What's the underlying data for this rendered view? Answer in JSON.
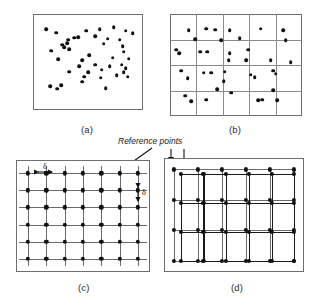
{
  "figure": {
    "panels": [
      {
        "id": "a",
        "caption": "(a)",
        "description": "randomly scattered points"
      },
      {
        "id": "b",
        "caption": "(b)",
        "description": "points partitioned by a grid of cells"
      },
      {
        "id": "c",
        "caption": "(c)",
        "description": "regular lattice of reference points with spacing delta"
      },
      {
        "id": "d",
        "caption": "(d)",
        "description": "two offset overlapping reference grids"
      }
    ]
  },
  "annotations": {
    "reference_points_label": "Reference points",
    "delta_horizontal": "δ",
    "delta_vertical": "δ"
  },
  "colors": {
    "dot": "#111111",
    "frame": "#6e6e6e",
    "gridline": "#8a8a8a",
    "lattice_primary": "#6a6a6a",
    "lattice_secondary": "#1a1a1a",
    "caption_text": "#2b2b2b",
    "background": "#ffffff"
  },
  "chart_data": {
    "type": "scatter",
    "xlabel": "",
    "ylabel": "",
    "xlim": [
      0,
      100
    ],
    "ylim": [
      0,
      100
    ],
    "grid": true,
    "legend": "none",
    "panels": [
      {
        "id": "a",
        "caption": "(a)",
        "type": "scatter",
        "grid": false,
        "n_points": 44,
        "points": [
          [
            8,
            88
          ],
          [
            18,
            84
          ],
          [
            40,
            79
          ],
          [
            48,
            86
          ],
          [
            62,
            88
          ],
          [
            76,
            90
          ],
          [
            88,
            86
          ],
          [
            95,
            83
          ],
          [
            30,
            76
          ],
          [
            36,
            78
          ],
          [
            57,
            80
          ],
          [
            70,
            77
          ],
          [
            82,
            76
          ],
          [
            24,
            70
          ],
          [
            26,
            67
          ],
          [
            29,
            72
          ],
          [
            31,
            65
          ],
          [
            85,
            68
          ],
          [
            86,
            62
          ],
          [
            13,
            63
          ],
          [
            66,
            71
          ],
          [
            20,
            53
          ],
          [
            44,
            52
          ],
          [
            51,
            58
          ],
          [
            75,
            55
          ],
          [
            91,
            54
          ],
          [
            41,
            45
          ],
          [
            57,
            47
          ],
          [
            72,
            45
          ],
          [
            84,
            47
          ],
          [
            88,
            43
          ],
          [
            31,
            39
          ],
          [
            50,
            38
          ],
          [
            64,
            41
          ],
          [
            86,
            38
          ],
          [
            46,
            33
          ],
          [
            63,
            32
          ],
          [
            79,
            35
          ],
          [
            90,
            33
          ],
          [
            12,
            22
          ],
          [
            19,
            19
          ],
          [
            23,
            23
          ],
          [
            68,
            20
          ],
          [
            44,
            27
          ]
        ]
      },
      {
        "id": "b",
        "caption": "(b)",
        "type": "scatter",
        "grid": true,
        "grid_cols": 5,
        "grid_rows": 4,
        "n_points": 37,
        "points": [
          [
            12,
            86
          ],
          [
            17,
            77
          ],
          [
            26,
            88
          ],
          [
            33,
            87
          ],
          [
            45,
            86
          ],
          [
            38,
            76
          ],
          [
            53,
            78
          ],
          [
            70,
            88
          ],
          [
            88,
            86
          ],
          [
            90,
            76
          ],
          [
            2,
            66
          ],
          [
            4,
            62
          ],
          [
            21,
            64
          ],
          [
            27,
            64
          ],
          [
            45,
            62
          ],
          [
            44,
            55
          ],
          [
            60,
            66
          ],
          [
            58,
            55
          ],
          [
            78,
            55
          ],
          [
            94,
            53
          ],
          [
            6,
            44
          ],
          [
            11,
            36
          ],
          [
            24,
            42
          ],
          [
            30,
            42
          ],
          [
            41,
            43
          ],
          [
            40,
            33
          ],
          [
            62,
            40
          ],
          [
            65,
            37
          ],
          [
            80,
            44
          ],
          [
            82,
            41
          ],
          [
            9,
            18
          ],
          [
            14,
            12
          ],
          [
            26,
            14
          ],
          [
            35,
            25
          ],
          [
            46,
            21
          ],
          [
            68,
            13
          ],
          [
            71,
            14
          ],
          [
            80,
            24
          ],
          [
            83,
            13
          ]
        ]
      },
      {
        "id": "c",
        "caption": "(c)",
        "type": "lattice",
        "grid": true,
        "lattice_cols": 7,
        "lattice_rows": 6,
        "spacing_label": "δ",
        "annotation": "Reference points"
      },
      {
        "id": "d",
        "caption": "(d)",
        "type": "lattice-pair",
        "grid": true,
        "lattice_cols": 6,
        "lattice_rows": 4,
        "offset_x": 5,
        "offset_y": 4,
        "n_grids": 2
      }
    ]
  }
}
